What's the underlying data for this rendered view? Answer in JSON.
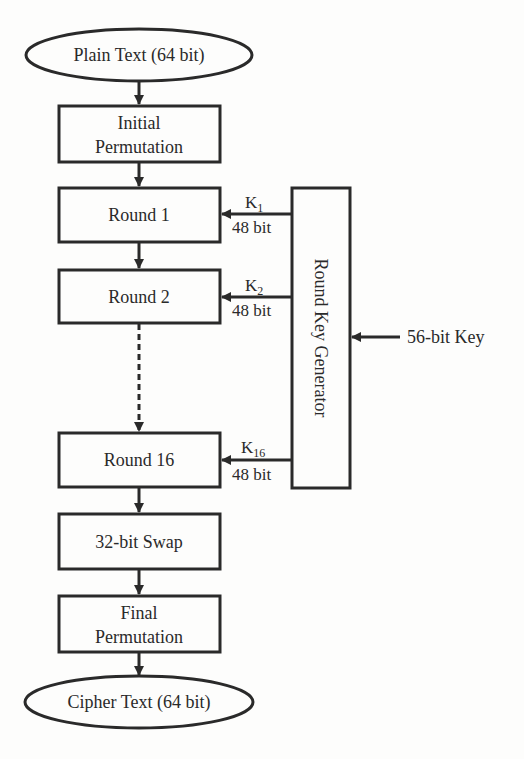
{
  "diagram": {
    "input": {
      "label": "Plain Text (64 bit)"
    },
    "initial_permutation": {
      "line1": "Initial",
      "line2": "Permutation"
    },
    "rounds": [
      {
        "label": "Round 1",
        "key": "K",
        "key_sub": "1",
        "key_bits": "48 bit"
      },
      {
        "label": "Round 2",
        "key": "K",
        "key_sub": "2",
        "key_bits": "48 bit"
      },
      {
        "label": "Round 16",
        "key": "K",
        "key_sub": "16",
        "key_bits": "48 bit"
      }
    ],
    "swap": {
      "label": "32-bit Swap"
    },
    "final_permutation": {
      "line1": "Final",
      "line2": "Permutation"
    },
    "output": {
      "label": "Cipher Text (64 bit)"
    },
    "key_generator": {
      "label": "Round Key Generator"
    },
    "key_input": {
      "label": "56-bit Key"
    }
  },
  "colors": {
    "stroke": "#2a2a2a",
    "background": "#fdfdfc"
  }
}
